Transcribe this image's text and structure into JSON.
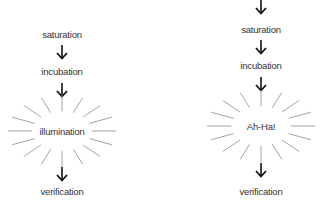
{
  "diagrams": [
    {
      "name": "creative-process-left",
      "steps": [
        "saturation",
        "incubation",
        "illumination",
        "verification"
      ],
      "highlight_step": "illumination"
    },
    {
      "name": "creative-process-right",
      "steps": [
        "saturation",
        "incubation",
        "Ah-Ha!",
        "verification"
      ],
      "highlight_step": "Ah-Ha!"
    }
  ],
  "colors": {
    "text": "#333333",
    "arrow": "#111111",
    "rays": "#888888"
  }
}
